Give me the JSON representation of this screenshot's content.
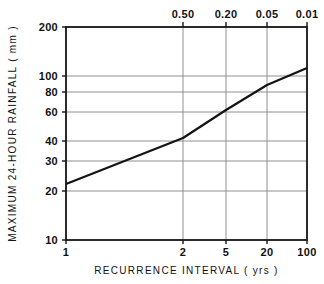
{
  "chart_data": {
    "type": "line",
    "title": "",
    "subtitle": "",
    "xlabel": "RECURRENCE  INTERVAL  ( yrs )",
    "ylabel": "MAXIMUM  24-HOUR  RAINFALL  ( mm )",
    "xlabel_top": "",
    "x_scale": "gumbel-probability",
    "y_scale": "log",
    "xlim": [
      1,
      100
    ],
    "ylim": [
      10,
      200
    ],
    "grid": true,
    "legend": "none",
    "x_ticks": [
      {
        "value": 1,
        "label": "1",
        "px": 66
      },
      {
        "value": 2,
        "label": "2",
        "px": 183
      },
      {
        "value": 5,
        "label": "5",
        "px": 226
      },
      {
        "value": 20,
        "label": "20",
        "px": 267
      },
      {
        "value": 100,
        "label": "100",
        "px": 307
      }
    ],
    "x_ticks_top": [
      {
        "value": 0.5,
        "label": "0.50",
        "px": 183
      },
      {
        "value": 0.2,
        "label": "0.20",
        "px": 226
      },
      {
        "value": 0.05,
        "label": "0.05",
        "px": 267
      },
      {
        "value": 0.01,
        "label": "0.01",
        "px": 307
      }
    ],
    "y_ticks": [
      {
        "value": 200,
        "label": "200",
        "px": 27
      },
      {
        "value": 100,
        "label": "100",
        "px": 76
      },
      {
        "value": 80,
        "label": "80",
        "px": 92
      },
      {
        "value": 60,
        "label": "60",
        "px": 112
      },
      {
        "value": 40,
        "label": "40",
        "px": 141
      },
      {
        "value": 30,
        "label": "30",
        "px": 161
      },
      {
        "value": 20,
        "label": "20",
        "px": 191
      },
      {
        "value": 10,
        "label": "10",
        "px": 240
      }
    ],
    "series": [
      {
        "name": "maximum 24-hour rainfall frequency curve",
        "color": "#141414",
        "points": [
          {
            "x": 1,
            "y": 22
          },
          {
            "x": 2,
            "y": 42
          },
          {
            "x": 5,
            "y": 62
          },
          {
            "x": 20,
            "y": 88
          },
          {
            "x": 100,
            "y": 112
          }
        ],
        "points_px": [
          {
            "x": 66,
            "y": 184
          },
          {
            "x": 183,
            "y": 138
          },
          {
            "x": 226,
            "y": 110
          },
          {
            "x": 267,
            "y": 85
          },
          {
            "x": 307,
            "y": 68
          }
        ]
      }
    ],
    "plot_area_px": {
      "left": 66,
      "top": 27,
      "right": 307,
      "bottom": 240
    }
  },
  "style": {
    "frame_color": "#141414",
    "grid_color": "#909090",
    "line_color": "#141414",
    "background": "#ffffff"
  }
}
